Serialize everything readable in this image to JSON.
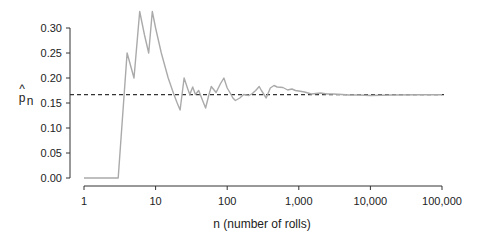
{
  "chart_data": {
    "type": "line",
    "title": "",
    "xlabel": "n (number of rolls)",
    "ylabel": "p̂_n",
    "xscale": "log",
    "xlim": [
      1,
      100000
    ],
    "ylim": [
      0,
      0.3
    ],
    "grid": false,
    "legend": null,
    "x_ticks": [
      1,
      10,
      100,
      1000,
      10000,
      100000
    ],
    "x_tick_labels": [
      "1",
      "10",
      "100",
      "1,000",
      "10,000",
      "100,000"
    ],
    "y_ticks": [
      0.0,
      0.05,
      0.1,
      0.15,
      0.2,
      0.25,
      0.3
    ],
    "y_tick_labels": [
      "0.00",
      "0.05",
      "0.10",
      "0.15",
      "0.20",
      "0.25",
      "0.30"
    ],
    "reference_line": {
      "y": 0.1667,
      "style": "dashed",
      "color": "#333333",
      "label": "1/6"
    },
    "series": [
      {
        "name": "running proportion",
        "color": "#aaaaaa",
        "x": [
          1,
          2,
          3,
          4,
          5,
          6,
          7,
          8,
          9,
          10,
          12,
          15,
          18,
          20,
          22,
          25,
          28,
          30,
          33,
          36,
          40,
          45,
          50,
          55,
          60,
          70,
          80,
          90,
          100,
          110,
          120,
          130,
          150,
          170,
          200,
          220,
          250,
          280,
          300,
          350,
          400,
          450,
          500,
          600,
          700,
          800,
          900,
          1000,
          1200,
          1500,
          2000,
          2500,
          3000,
          4000,
          5000,
          7000,
          10000,
          20000,
          50000,
          100000
        ],
        "y": [
          0.0,
          0.0,
          0.0,
          0.25,
          0.2,
          0.333,
          0.286,
          0.25,
          0.333,
          0.3,
          0.25,
          0.2,
          0.167,
          0.15,
          0.136,
          0.2,
          0.179,
          0.167,
          0.182,
          0.167,
          0.175,
          0.156,
          0.14,
          0.164,
          0.183,
          0.171,
          0.188,
          0.2,
          0.18,
          0.17,
          0.16,
          0.155,
          0.16,
          0.167,
          0.165,
          0.168,
          0.175,
          0.183,
          0.175,
          0.16,
          0.18,
          0.185,
          0.182,
          0.181,
          0.176,
          0.178,
          0.175,
          0.174,
          0.172,
          0.168,
          0.17,
          0.168,
          0.168,
          0.167,
          0.166,
          0.166,
          0.165,
          0.166,
          0.1665,
          0.1667
        ]
      }
    ]
  },
  "axes": {
    "xlabel": "n (number of rolls)",
    "ylabel_main": "p",
    "ylabel_hat": "^",
    "ylabel_sub": "n"
  }
}
